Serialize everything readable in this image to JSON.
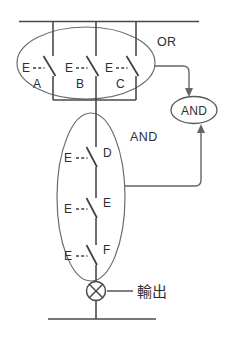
{
  "diagram": {
    "type": "ladder-logic-contact-diagram",
    "title_visible": false,
    "colors": {
      "wire": "#4a4a4a",
      "group_outline": "#6b6b6b",
      "connector": "#666666",
      "text": "#2e2e2e",
      "background": "#ffffff"
    },
    "or_group": {
      "label": "OR",
      "contacts": [
        {
          "terminal": "E",
          "name": "A"
        },
        {
          "terminal": "E",
          "name": "B"
        },
        {
          "terminal": "E",
          "name": "C"
        }
      ]
    },
    "and_group": {
      "label": "AND",
      "contacts": [
        {
          "terminal": "E",
          "name": "D"
        },
        {
          "terminal": "E",
          "name": "E"
        },
        {
          "terminal": "E",
          "name": "F"
        }
      ]
    },
    "gate": {
      "label": "AND"
    },
    "output": {
      "label": "輸出",
      "symbol": "lamp-cross-circle"
    }
  }
}
